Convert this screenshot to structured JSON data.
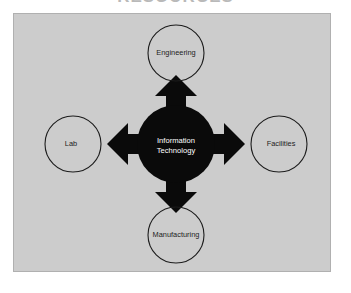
{
  "page": {
    "title_sliver": "RESOURCES",
    "background_color": "#ffffff"
  },
  "diagram": {
    "type": "hub-and-spoke",
    "panel_color": "#cccccc",
    "border_color": "#b0b0b0",
    "hub": {
      "name": "information-technology",
      "label_line1": "Information",
      "label_line2": "Technology",
      "fill_color": "#0a0a0a",
      "text_color": "#ffffff",
      "cx": 162,
      "cy": 130,
      "r": 39
    },
    "arrow_color": "#0a0a0a",
    "nodes": [
      {
        "name": "engineering",
        "label": "Engineering",
        "direction": "up",
        "cx": 162,
        "cy": 39,
        "r": 28
      },
      {
        "name": "lab",
        "label": "Lab",
        "direction": "left",
        "cx": 59,
        "cy": 130,
        "r": 28
      },
      {
        "name": "facilities",
        "label": "Facilities",
        "direction": "right",
        "cx": 265,
        "cy": 130,
        "r": 28
      },
      {
        "name": "manufacturing",
        "label": "Manufacturing",
        "direction": "down",
        "cx": 162,
        "cy": 221,
        "r": 28
      }
    ]
  }
}
